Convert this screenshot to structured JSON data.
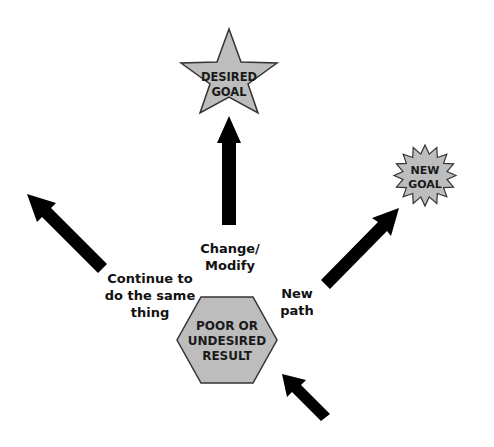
{
  "diagram": {
    "title": "",
    "colors": {
      "shape_fill": "#bdbdbd",
      "shape_stroke": "#333333",
      "arrow": "#000000",
      "text": "#111111",
      "background": "#ffffff"
    },
    "nodes": {
      "desired_goal": {
        "shape": "star",
        "line1": "DESIRED",
        "line2": "GOAL"
      },
      "new_goal": {
        "shape": "starburst",
        "line1": "NEW",
        "line2": "GOAL"
      },
      "poor_result": {
        "shape": "hexagon",
        "line1": "POOR OR",
        "line2": "UNDESIRED",
        "line3": "RESULT"
      }
    },
    "paths": {
      "continue": {
        "line1": "Continue to",
        "line2": "do the same",
        "line3": "thing"
      },
      "change": {
        "line1": "Change/",
        "line2": "Modify"
      },
      "new_path": {
        "line1": "New",
        "line2": "path"
      }
    },
    "arrows": [
      {
        "id": "arrow-to-desired-goal",
        "direction": "up"
      },
      {
        "id": "arrow-continue-same",
        "direction": "up-left"
      },
      {
        "id": "arrow-to-new-goal",
        "direction": "up-right"
      },
      {
        "id": "arrow-into-result",
        "direction": "up-left"
      }
    ]
  }
}
